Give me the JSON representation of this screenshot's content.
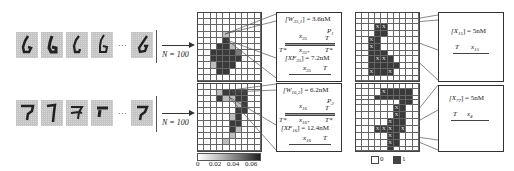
{
  "figure": {
    "rows": [
      {
        "digit_class": "6",
        "sample_count_label": "N = 100",
        "ellipsis": "···",
        "weights_box": {
          "weight_label": "[W",
          "weight_sub": "35,1",
          "weight_value": "] = 3.6nM",
          "strand_top_label": "x",
          "strand_top_sub": "35",
          "strand_top_T": "T",
          "probe_label": "P",
          "probe_sub": "1",
          "left_T": "T*",
          "mid_label": "x",
          "mid_sub": "35*",
          "right_T": "T*",
          "xf_label": "[XF",
          "xf_sub": "35",
          "xf_value": "] = 7.2nM",
          "bottom_label": "x",
          "bottom_sub": "35",
          "bottom_T": "T"
        },
        "input_box": {
          "label": "[X",
          "label_sub": "15",
          "value": "] = 5nM",
          "strand_T": "T",
          "strand_x": "x",
          "strand_x_sub": "15"
        }
      },
      {
        "digit_class": "7",
        "sample_count_label": "N = 100",
        "ellipsis": "···",
        "weights_box": {
          "weight_label": "[W",
          "weight_sub": "16,2",
          "weight_value": "] = 6.2nM",
          "strand_top_label": "x",
          "strand_top_sub": "16",
          "strand_top_T": "T",
          "probe_label": "P",
          "probe_sub": "2",
          "left_T": "T*",
          "mid_label": "x",
          "mid_sub": "16*",
          "right_T": "T*",
          "xf_label": "[XF",
          "xf_sub": "16",
          "xf_value": "] = 12.4nM",
          "bottom_label": "x",
          "bottom_sub": "16",
          "bottom_T": "T"
        },
        "input_box": {
          "label": "[X",
          "label_sub": "77",
          "value": "] = 5nM",
          "strand_T": "T",
          "strand_x": "x",
          "strand_x_sub": "4"
        }
      }
    ],
    "colorbar": {
      "ticks": [
        "0",
        "0.02",
        "0.04",
        "0.06"
      ]
    },
    "binary_legend": {
      "zero_label": "0",
      "one_label": "1"
    },
    "cell_marker": "X",
    "colors": {
      "grid_line": "#666666",
      "dark_cell": "#3a3a3a",
      "mid_cell": "#7a7a7a",
      "light_cell": "#bdbdbd",
      "digit_bg": "#d8d8d8",
      "digit_ink": "#222222"
    }
  }
}
